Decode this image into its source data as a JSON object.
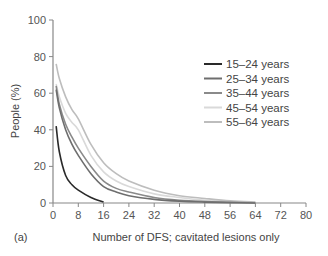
{
  "panel_label": "(a)",
  "chart_data": {
    "type": "line",
    "title": "",
    "xlabel": "Number of DFS; cavitated lesions only",
    "ylabel": "People (%)",
    "xlim": [
      0,
      80
    ],
    "ylim": [
      0,
      100
    ],
    "x_ticks": [
      0,
      8,
      16,
      24,
      32,
      40,
      48,
      56,
      64,
      72,
      80
    ],
    "y_ticks": [
      0,
      20,
      40,
      60,
      80,
      100
    ],
    "grid": false,
    "legend_position": "upper right",
    "x": [
      1,
      2,
      4,
      6,
      8,
      12,
      16,
      20,
      24,
      32,
      40,
      48,
      56,
      64
    ],
    "series": [
      {
        "name": "15–24 years",
        "color": "#2a2a2a",
        "values": [
          42,
          28,
          15,
          10,
          7,
          3,
          0.5,
          null,
          null,
          null,
          null,
          null,
          null,
          null
        ]
      },
      {
        "name": "25–34 years",
        "color": "#6e6e6e",
        "values": [
          62,
          52,
          40,
          32,
          26,
          16,
          9,
          6,
          4,
          2,
          1,
          0.5,
          0.2,
          0
        ]
      },
      {
        "name": "35–44 years",
        "color": "#8a8a8a",
        "values": [
          64,
          54,
          43,
          36,
          30,
          20,
          12,
          8,
          6,
          3,
          1.5,
          0.8,
          0.4,
          0
        ]
      },
      {
        "name": "45–54 years",
        "color": "#d9d9d9",
        "values": [
          65,
          58,
          49,
          44,
          40,
          26,
          17,
          12,
          9,
          5,
          3,
          1.5,
          0.8,
          0.2
        ]
      },
      {
        "name": "55–64 years",
        "color": "#bdbdbd",
        "values": [
          76,
          68,
          58,
          51,
          46,
          32,
          22,
          16,
          12,
          7,
          4,
          2.5,
          1.2,
          0.5
        ]
      }
    ]
  }
}
